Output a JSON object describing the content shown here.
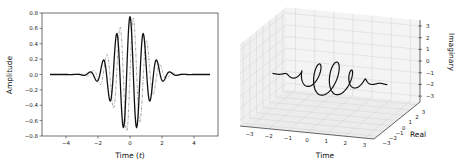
{
  "chart_data": [
    {
      "type": "line",
      "title": "",
      "xlabel": "Time (t)",
      "ylabel": "Amplitude",
      "xlim": [
        -5.5,
        5.5
      ],
      "ylim": [
        -0.8,
        0.8
      ],
      "xticks": [
        -4,
        -2,
        0,
        2,
        4
      ],
      "yticks": [
        -0.8,
        -0.6,
        -0.4,
        -0.2,
        0.0,
        0.2,
        0.4,
        0.6,
        0.8
      ],
      "ytick_labels": [
        "−0.8",
        "−0.6",
        "−0.4",
        "−0.2",
        "0.0",
        "0.2",
        "0.4",
        "0.6",
        "0.8"
      ],
      "xtick_labels": [
        "−4",
        "−2",
        "0",
        "2",
        "4"
      ],
      "grid": false,
      "legend": null,
      "series": [
        {
          "name": "Real part",
          "style": "solid",
          "color": "#111111",
          "function": "A*exp(-t^2/(2*sigma^2))*cos(omega*t)",
          "params": {
            "A": 0.75,
            "sigma": 1.0,
            "omega": 7.5
          },
          "x_range": [
            -5,
            5
          ]
        },
        {
          "name": "Imaginary part",
          "style": "dashdot",
          "color": "#999999",
          "function": "A*exp(-t^2/(2*sigma^2))*sin(omega*t)",
          "params": {
            "A": 0.75,
            "sigma": 1.0,
            "omega": 7.5
          },
          "x_range": [
            -5,
            5
          ]
        }
      ]
    },
    {
      "type": "line3d",
      "title": "",
      "xlabel": "Time",
      "ylabel": "Real",
      "zlabel": "Imaginary",
      "xlim": [
        -3.5,
        3.5
      ],
      "ylim": [
        -3.5,
        3.5
      ],
      "zlim": [
        -3.5,
        3.5
      ],
      "xticks": [
        -3,
        -2,
        -1,
        0,
        1,
        2,
        3
      ],
      "yticks": [
        -3,
        -2,
        -1,
        0,
        1,
        2,
        3
      ],
      "zticks": [
        -3,
        -2,
        -1,
        0,
        1,
        2,
        3
      ],
      "tick_labels": [
        "−3",
        "−2",
        "−1",
        "0",
        "1",
        "2",
        "3"
      ],
      "grid": true,
      "series": [
        {
          "name": "Complex wave packet (helix)",
          "style": "solid",
          "color": "#111111",
          "function": "(t, Re, Im) = (t, A*exp(-t^2/(2*sigma^2))*cos(omega*t), A*exp(-t^2/(2*sigma^2))*sin(omega*t))",
          "params": {
            "A": 0.75,
            "sigma": 1.0,
            "omega": 7.5
          },
          "x_range": [
            -3,
            3
          ]
        }
      ]
    }
  ]
}
